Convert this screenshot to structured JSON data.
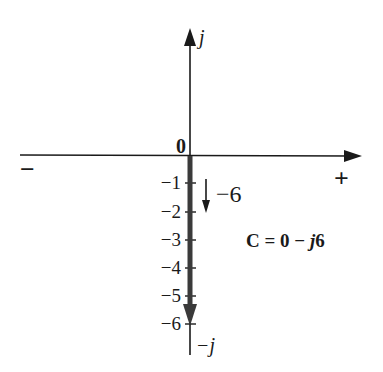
{
  "diagram": {
    "axes": {
      "imag_positive_label": "j",
      "imag_negative_label": "−j",
      "real_negative_label": "−",
      "real_positive_label": "+",
      "origin_label": "0"
    },
    "ticks": [
      {
        "label": "−1",
        "value": -1
      },
      {
        "label": "−2",
        "value": -2
      },
      {
        "label": "−3",
        "value": -3
      },
      {
        "label": "−4",
        "value": -4
      },
      {
        "label": "−5",
        "value": -5
      },
      {
        "label": "−6",
        "value": -6
      }
    ],
    "vector": {
      "real": 0,
      "imag": -6,
      "magnitude_label": "−6"
    },
    "equation": {
      "lhs": "C = 0 − ",
      "j": "j",
      "num": "6"
    },
    "colors": {
      "axis": "#1a1a1a",
      "vector": "#3a3a3a",
      "background": "#ffffff"
    }
  }
}
